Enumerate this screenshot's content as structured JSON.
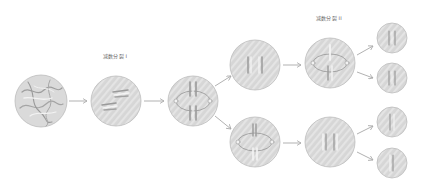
{
  "diagram": {
    "labels": {
      "meiosis_1": "减数分裂 I",
      "meiosis_2": "减数分裂 II"
    },
    "colors": {
      "cell_fill": "#d6d6d6",
      "cell_stripe": "#e6e6e6",
      "cell_border": "#bdbdbd",
      "chromosome": "#9a9a9a",
      "chromosome_highlight": "#f4f4f4",
      "arrow": "#a8a8a8",
      "spindle": "#8c8c8c"
    },
    "cells": [
      {
        "id": "interphase",
        "cx": 41,
        "cy": 101,
        "r": 26,
        "content": "tangled chromatin"
      },
      {
        "id": "prophase-1",
        "cx": 116,
        "cy": 101,
        "r": 25,
        "content": "paired homologs"
      },
      {
        "id": "metaphase-1",
        "cx": 193,
        "cy": 101,
        "r": 25,
        "content": "spindle with tetrads"
      },
      {
        "id": "daughter-top",
        "cx": 255,
        "cy": 65,
        "r": 25,
        "content": "two chromosomes"
      },
      {
        "id": "daughter-bottom",
        "cx": 255,
        "cy": 142,
        "r": 25,
        "content": "spindle with dyads"
      },
      {
        "id": "metaphase-2-top",
        "cx": 330,
        "cy": 63,
        "r": 25,
        "content": "spindle"
      },
      {
        "id": "metaphase-2-bottom",
        "cx": 330,
        "cy": 142,
        "r": 25,
        "content": "two chromosomes"
      },
      {
        "id": "gamete-1",
        "cx": 392,
        "cy": 38,
        "r": 15,
        "content": "chromatids"
      },
      {
        "id": "gamete-2",
        "cx": 392,
        "cy": 78,
        "r": 15,
        "content": "chromatids"
      },
      {
        "id": "gamete-3",
        "cx": 392,
        "cy": 122,
        "r": 15,
        "content": "chromatids"
      },
      {
        "id": "gamete-4",
        "cx": 392,
        "cy": 163,
        "r": 15,
        "content": "chromatids"
      }
    ],
    "arrows": [
      {
        "from": "interphase",
        "to": "prophase-1"
      },
      {
        "from": "prophase-1",
        "to": "metaphase-1"
      },
      {
        "from": "metaphase-1",
        "to": "daughter-top"
      },
      {
        "from": "metaphase-1",
        "to": "daughter-bottom"
      },
      {
        "from": "daughter-top",
        "to": "metaphase-2-top"
      },
      {
        "from": "daughter-bottom",
        "to": "metaphase-2-bottom"
      },
      {
        "from": "metaphase-2-top",
        "to": "gamete-1"
      },
      {
        "from": "metaphase-2-top",
        "to": "gamete-2"
      },
      {
        "from": "metaphase-2-bottom",
        "to": "gamete-3"
      },
      {
        "from": "metaphase-2-bottom",
        "to": "gamete-4"
      }
    ]
  }
}
